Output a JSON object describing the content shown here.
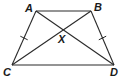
{
  "diagram": {
    "type": "geometry",
    "points": {
      "A": {
        "label": "A",
        "x": 36,
        "y": 11
      },
      "B": {
        "label": "B",
        "x": 91,
        "y": 11
      },
      "C": {
        "label": "C",
        "x": 12,
        "y": 65
      },
      "D": {
        "label": "D",
        "x": 114,
        "y": 65
      },
      "X": {
        "label": "X",
        "x": 63,
        "y": 30
      }
    },
    "segments": [
      {
        "from": "A",
        "to": "B",
        "kind": "side"
      },
      {
        "from": "C",
        "to": "D",
        "kind": "side"
      },
      {
        "from": "A",
        "to": "C",
        "kind": "side",
        "tick_marks": 1
      },
      {
        "from": "B",
        "to": "D",
        "kind": "side",
        "tick_marks": 1
      },
      {
        "from": "A",
        "to": "D",
        "kind": "diagonal"
      },
      {
        "from": "B",
        "to": "C",
        "kind": "diagonal"
      }
    ],
    "congruent_marks": [
      [
        "AC",
        "BD"
      ]
    ],
    "stroke_color": "#2a2a2a"
  }
}
